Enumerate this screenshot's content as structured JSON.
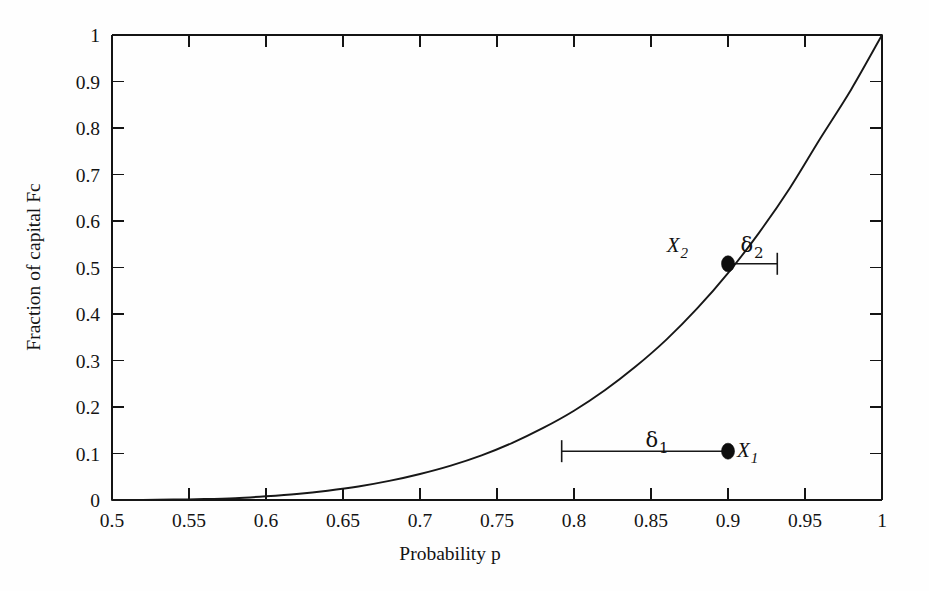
{
  "figure": {
    "name": "kelly-fraction-of-capital-plot",
    "background_color": "#fefefe",
    "ink_color": "#141414"
  },
  "chart_data": {
    "type": "line",
    "title": "",
    "subtitle": "",
    "xlabel": "Probability p",
    "ylabel": "Fraction of capital Fc",
    "xlim": [
      0.5,
      1.0
    ],
    "ylim": [
      0.0,
      1.0
    ],
    "grid": false,
    "legend": null,
    "legend_position": "none",
    "x_ticks": [
      0.5,
      0.55,
      0.6,
      0.65,
      0.7,
      0.75,
      0.8,
      0.85,
      0.9,
      0.95,
      1.0
    ],
    "x_tick_labels": [
      "0.5",
      "0.55",
      "0.6",
      "0.65",
      "0.7",
      "0.75",
      "0.8",
      "0.85",
      "0.9",
      "0.95",
      "1"
    ],
    "y_ticks": [
      0,
      0.1,
      0.2,
      0.3,
      0.4,
      0.5,
      0.6,
      0.7,
      0.8,
      0.9,
      1.0
    ],
    "y_tick_labels": [
      "0",
      "0.1",
      "0.2",
      "0.3",
      "0.4",
      "0.5",
      "0.6",
      "0.7",
      "0.8",
      "0.9",
      "1"
    ],
    "series": [
      {
        "name": "Fc(p)",
        "x": [
          0.5,
          0.52,
          0.54,
          0.56,
          0.58,
          0.6,
          0.62,
          0.64,
          0.66,
          0.68,
          0.7,
          0.72,
          0.74,
          0.76,
          0.78,
          0.8,
          0.82,
          0.84,
          0.86,
          0.88,
          0.9,
          0.92,
          0.94,
          0.96,
          0.98,
          1.0
        ],
        "y": [
          0.0,
          0.0,
          0.001,
          0.002,
          0.004,
          0.008,
          0.013,
          0.02,
          0.029,
          0.041,
          0.056,
          0.074,
          0.096,
          0.123,
          0.155,
          0.192,
          0.236,
          0.287,
          0.345,
          0.412,
          0.488,
          0.574,
          0.67,
          0.778,
          0.883,
          1.0
        ]
      }
    ],
    "annotations": [
      {
        "name": "point-x1",
        "label": "X",
        "subscript": "1",
        "x": 0.9,
        "y": 0.105,
        "marker": "filled-circle"
      },
      {
        "name": "point-x2",
        "label": "X",
        "subscript": "2",
        "x": 0.9,
        "y": 0.508,
        "marker": "filled-circle"
      },
      {
        "name": "delta-1",
        "label": "δ",
        "subscript": "1",
        "from_x": 0.792,
        "to_x": 0.9,
        "y": 0.105,
        "description": "horizontal offset from curve to X1"
      },
      {
        "name": "delta-2",
        "label": "δ",
        "subscript": "2",
        "from_x": 0.9,
        "to_x": 0.932,
        "y": 0.508,
        "description": "horizontal offset from X2 to curve"
      }
    ]
  },
  "labels": {
    "x_axis_title": "Probability p",
    "y_axis_title": "Fraction of capital Fc",
    "x1_base": "X",
    "x1_sub": "1",
    "x2_base": "X",
    "x2_sub": "2",
    "d1_base": "δ",
    "d1_sub": "1",
    "d2_base": "δ",
    "d2_sub": "2"
  }
}
